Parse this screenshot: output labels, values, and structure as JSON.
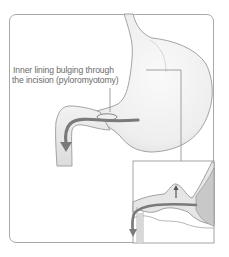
{
  "figure": {
    "callout": {
      "line1": "Inner lining bulging through",
      "line2": "the incision (pyloromyotomy)"
    },
    "parts": [
      "stomach",
      "pylorus",
      "duodenum",
      "inset-cross-section"
    ],
    "colors": {
      "outline": "#8a8a8a",
      "arrow": "#7a7a7a",
      "frame": "#a8a8a8",
      "text": "#6a6a6a"
    }
  }
}
